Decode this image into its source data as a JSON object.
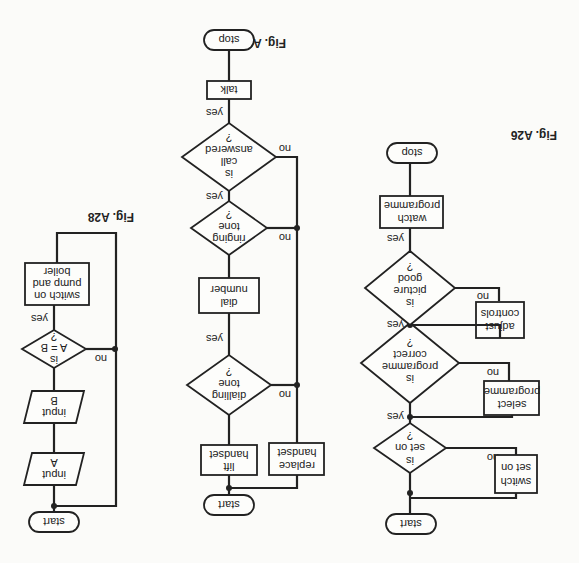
{
  "orientation": "rotated-180",
  "figures": [
    {
      "caption": "Fig. A26",
      "nodes": {
        "start": "start",
        "d1": [
          "is",
          "set on",
          "?"
        ],
        "p1": [
          "switch",
          "set on"
        ],
        "d2": [
          "is",
          "programme",
          "correct",
          "?"
        ],
        "p2": [
          "select",
          "programme"
        ],
        "d3": [
          "is",
          "picture",
          "good",
          "?"
        ],
        "p3": [
          "adjust",
          "controls"
        ],
        "p4": [
          "watch",
          "programme"
        ],
        "stop": "stop"
      },
      "labels": {
        "yes": "yes",
        "no": "no"
      }
    },
    {
      "caption": "Fig. A27",
      "nodes": {
        "start": "start",
        "p1": [
          "lift",
          "handset"
        ],
        "d1": [
          "dialling",
          "tone",
          "?"
        ],
        "p2": [
          "dial",
          "number"
        ],
        "d2": [
          "ringing",
          "tone",
          "?"
        ],
        "d3": [
          "is",
          "call",
          "answered",
          "?"
        ],
        "p3": [
          "talk"
        ],
        "stop": "stop",
        "p4": [
          "replace",
          "handset"
        ]
      },
      "labels": {
        "yes": "yes",
        "no": "no"
      }
    },
    {
      "caption": "Fig. A28",
      "nodes": {
        "start": "start",
        "io1": [
          "input",
          "A"
        ],
        "io2": [
          "input",
          "B"
        ],
        "d1": [
          "is",
          "A = B",
          "?"
        ],
        "p1": [
          "switch on",
          "pump and",
          "boiler"
        ]
      },
      "labels": {
        "yes": "yes",
        "no": "no"
      }
    }
  ]
}
